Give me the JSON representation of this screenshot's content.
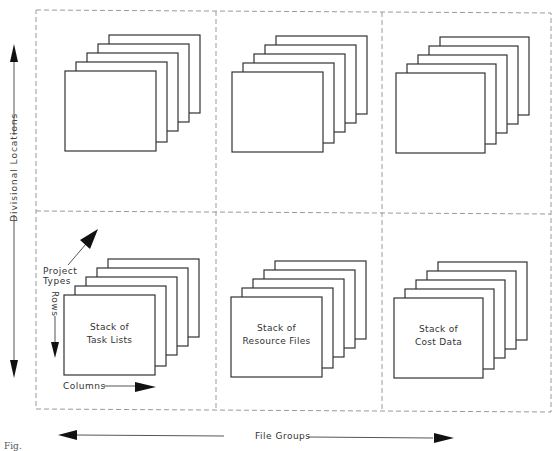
{
  "diagram": {
    "axes": {
      "vertical": "Divisional Locations",
      "horizontal": "File Groups"
    },
    "legend": {
      "depth": "Project Types",
      "rows": "Rows",
      "columns": "Columns"
    },
    "grid": {
      "rows": 2,
      "columns": 3,
      "border_style": "dashed",
      "border_color": "#9a9a9a"
    },
    "cells": [
      {
        "row": 0,
        "col": 0,
        "label_line1": "",
        "label_line2": ""
      },
      {
        "row": 0,
        "col": 1,
        "label_line1": "",
        "label_line2": ""
      },
      {
        "row": 0,
        "col": 2,
        "label_line1": "",
        "label_line2": ""
      },
      {
        "row": 1,
        "col": 0,
        "label_line1": "Stack of",
        "label_line2": "Task Lists"
      },
      {
        "row": 1,
        "col": 1,
        "label_line1": "Stack of",
        "label_line2": "Resource Files"
      },
      {
        "row": 1,
        "col": 2,
        "label_line1": "Stack of",
        "label_line2": "Cost Data"
      }
    ],
    "pages_per_stack": 5,
    "caption": "Fig."
  }
}
